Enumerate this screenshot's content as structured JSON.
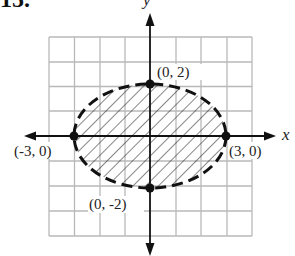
{
  "problem_number": "15.",
  "axes": {
    "x_label": "x",
    "y_label": "y"
  },
  "grid": {
    "min": -4,
    "max": 4,
    "step": 1,
    "color": "#b8b8b8"
  },
  "ellipse": {
    "equation": "x^2/9 + y^2/4 < 1",
    "center": [
      0,
      0
    ],
    "semi_axis_x": 3,
    "semi_axis_y": 2,
    "boundary": "dashed",
    "fill": "hatched"
  },
  "points": [
    {
      "label": "(0, 2)",
      "x": 0,
      "y": 2
    },
    {
      "label": "(-3, 0)",
      "x": -3,
      "y": 0
    },
    {
      "label": "(3, 0)",
      "x": 3,
      "y": 0
    },
    {
      "label": "(0, -2)",
      "x": 0,
      "y": -2
    }
  ]
}
